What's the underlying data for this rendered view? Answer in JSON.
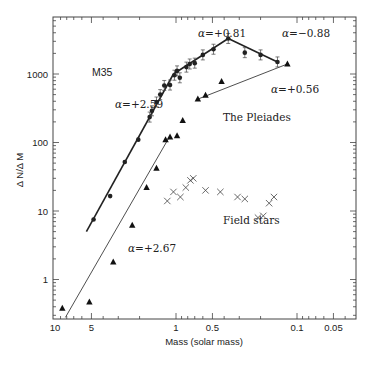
{
  "chart_data": {
    "type": "scatter",
    "title": "",
    "xlabel": "Mass (solar mass)",
    "ylabel": "Δ N/Δ M",
    "xscale": "log",
    "yscale": "log",
    "x_reversed": true,
    "xlim": [
      10,
      0.035
    ],
    "ylim": [
      0.3,
      8000
    ],
    "grid": false,
    "legend_position": "inline annotations",
    "x_ticks": [
      {
        "value": 10,
        "label": "10"
      },
      {
        "value": 5,
        "label": "5"
      },
      {
        "value": 1,
        "label": "1"
      },
      {
        "value": 0.5,
        "label": "0.5"
      },
      {
        "value": 0.1,
        "label": "0.1"
      },
      {
        "value": 0.05,
        "label": "0.05"
      }
    ],
    "y_ticks": [
      {
        "value": 1,
        "label": "1"
      },
      {
        "value": 10,
        "label": "10"
      },
      {
        "value": 100,
        "label": "100"
      },
      {
        "value": 1000,
        "label": "1000"
      }
    ],
    "series": [
      {
        "name": "M35",
        "marker": "circle",
        "color": "#222222",
        "points": [
          {
            "m": 4.8,
            "n": 7.5
          },
          {
            "m": 3.5,
            "n": 16.5
          },
          {
            "m": 2.65,
            "n": 52
          },
          {
            "m": 2.05,
            "n": 110
          },
          {
            "m": 1.65,
            "n": 235
          },
          {
            "m": 1.58,
            "n": 290
          },
          {
            "m": 1.45,
            "n": 390
          },
          {
            "m": 1.35,
            "n": 500
          },
          {
            "m": 1.25,
            "n": 680
          },
          {
            "m": 1.12,
            "n": 690
          },
          {
            "m": 1.03,
            "n": 960
          },
          {
            "m": 0.98,
            "n": 1110
          },
          {
            "m": 0.93,
            "n": 880
          },
          {
            "m": 0.82,
            "n": 1260
          },
          {
            "m": 0.77,
            "n": 1400
          },
          {
            "m": 0.7,
            "n": 1440
          },
          {
            "m": 0.6,
            "n": 1900
          },
          {
            "m": 0.49,
            "n": 2300
          },
          {
            "m": 0.37,
            "n": 3300
          },
          {
            "m": 0.27,
            "n": 2050
          },
          {
            "m": 0.2,
            "n": 1900
          },
          {
            "m": 0.145,
            "n": 1500
          }
        ]
      },
      {
        "name": "The Pleiades",
        "marker": "triangle",
        "color": "#111111",
        "points": [
          {
            "m": 8.7,
            "n": 0.38
          },
          {
            "m": 5.2,
            "n": 0.47
          },
          {
            "m": 3.3,
            "n": 1.8
          },
          {
            "m": 2.3,
            "n": 6.2
          },
          {
            "m": 1.75,
            "n": 22
          },
          {
            "m": 1.45,
            "n": 42
          },
          {
            "m": 1.22,
            "n": 110
          },
          {
            "m": 1.12,
            "n": 120
          },
          {
            "m": 0.98,
            "n": 125
          },
          {
            "m": 0.88,
            "n": 210
          },
          {
            "m": 0.66,
            "n": 430
          },
          {
            "m": 0.57,
            "n": 490
          },
          {
            "m": 0.42,
            "n": 780
          },
          {
            "m": 0.12,
            "n": 1400
          }
        ]
      },
      {
        "name": "Field stars",
        "marker": "x",
        "color": "#444444",
        "points": [
          {
            "m": 1.18,
            "n": 14
          },
          {
            "m": 1.05,
            "n": 19
          },
          {
            "m": 0.92,
            "n": 16
          },
          {
            "m": 0.83,
            "n": 22
          },
          {
            "m": 0.76,
            "n": 28
          },
          {
            "m": 0.72,
            "n": 30
          },
          {
            "m": 0.57,
            "n": 20
          },
          {
            "m": 0.43,
            "n": 19
          },
          {
            "m": 0.31,
            "n": 16
          },
          {
            "m": 0.27,
            "n": 15
          },
          {
            "m": 0.21,
            "n": 8
          },
          {
            "m": 0.19,
            "n": 8.5
          },
          {
            "m": 0.17,
            "n": 13
          },
          {
            "m": 0.155,
            "n": 16
          }
        ]
      }
    ],
    "fit_lines": [
      {
        "name": "M35 alpha +2.59",
        "style": "thick",
        "from": {
          "m": 5.5,
          "n": 5
        },
        "to": {
          "m": 1.05,
          "n": 1000
        }
      },
      {
        "name": "M35 alpha +0.81",
        "style": "thick",
        "from": {
          "m": 1.05,
          "n": 1000
        },
        "to": {
          "m": 0.37,
          "n": 3300
        }
      },
      {
        "name": "M35 alpha -0.88",
        "style": "thick",
        "from": {
          "m": 0.37,
          "n": 3300
        },
        "to": {
          "m": 0.145,
          "n": 1500
        }
      },
      {
        "name": "Pleiades alpha +2.67",
        "style": "thin",
        "from": {
          "m": 8.2,
          "n": 0.28
        },
        "to": {
          "m": 1.12,
          "n": 125
        }
      },
      {
        "name": "Pleiades alpha +0.56",
        "style": "thin",
        "from": {
          "m": 0.66,
          "n": 430
        },
        "to": {
          "m": 0.12,
          "n": 1400
        }
      }
    ],
    "annotations": [
      {
        "text": "M35",
        "x_px": 92,
        "y_px": 76
      },
      {
        "text": "α=+2.59",
        "x_px": 115,
        "y_px": 108
      },
      {
        "text": "α=+0.81",
        "x_px": 198,
        "y_px": 37
      },
      {
        "text": "α=−0.88",
        "x_px": 282,
        "y_px": 37
      },
      {
        "text": "α=+0.56",
        "x_px": 271,
        "y_px": 93
      },
      {
        "text": "The Pleiades",
        "x_px": 223,
        "y_px": 121
      },
      {
        "text": "Field stars",
        "x_px": 223,
        "y_px": 224
      },
      {
        "text": "α=+2.67",
        "x_px": 128,
        "y_px": 252
      }
    ]
  }
}
